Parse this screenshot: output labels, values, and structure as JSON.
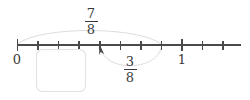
{
  "diagram": {
    "type": "number-line-fraction-model",
    "title": "",
    "number_line": {
      "start_label": "0",
      "end_label": "1",
      "start_value": 0,
      "whole_value": 1,
      "denominator": 8,
      "tick_values": [
        "0",
        "1/8",
        "2/8",
        "3/8",
        "4/8",
        "5/8",
        "6/8",
        "7/8",
        "1",
        "9/8",
        "10/8"
      ],
      "labeled_ticks": [
        {
          "label": "0",
          "value": 0
        },
        {
          "label": "1",
          "value": 1
        }
      ],
      "axis_color": "#4a4a4a"
    },
    "arcs": [
      {
        "name": "upper-arc",
        "direction": "right",
        "from_value": 0,
        "to_value": 0.875,
        "label_numerator": "7",
        "label_denominator": "8",
        "color": "#d8d8d8"
      },
      {
        "name": "lower-arc",
        "direction": "left",
        "from_value": 0.875,
        "to_value": 0.5,
        "label_numerator": "3",
        "label_denominator": "8",
        "color": "#d8d8d8"
      }
    ],
    "pointer": {
      "name": "result-arrow",
      "value": 0.5,
      "label": "4/8",
      "color": "#4a4a4a"
    },
    "answer_box": {
      "value": "",
      "placeholder": "",
      "border_color": "#e2e2e2"
    }
  }
}
